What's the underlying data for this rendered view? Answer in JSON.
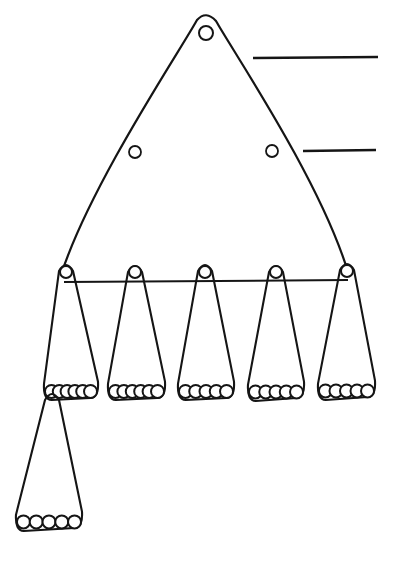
{
  "figure": {
    "background_color": "#ffffff",
    "ink_color": "#151515",
    "canvas": {
      "width": 397,
      "height": 564
    },
    "main_triangle": {
      "name": "large-triangle",
      "apex": {
        "x": 206,
        "y": 17
      },
      "left_base": {
        "x": 62,
        "y": 272
      },
      "right_base": {
        "x": 348,
        "y": 272
      },
      "stroke_width": 2.2,
      "apex_circle": {
        "cx": 206,
        "cy": 33,
        "r": 7
      },
      "side_circles": [
        {
          "name": "left-side-circle",
          "cx": 135,
          "cy": 152,
          "r": 6
        },
        {
          "name": "right-side-circle",
          "cx": 272,
          "cy": 151,
          "r": 6
        }
      ]
    },
    "crossbar": {
      "name": "apex-crossbar",
      "x1": 64,
      "y1": 282,
      "x2": 348,
      "y2": 280,
      "stroke_width": 2
    },
    "small_triangles": [
      {
        "id": "triangle-1",
        "apex": {
          "x": 66,
          "y": 264
        },
        "base_left": {
          "x": 44,
          "y": 396
        },
        "base_right": {
          "x": 98,
          "y": 394
        },
        "apex_circle": {
          "cx": 66,
          "cy": 272,
          "r": 6
        },
        "base_circle_count": 6,
        "base_circle_radius": 6.5
      },
      {
        "id": "triangle-2",
        "apex": {
          "x": 135,
          "y": 265
        },
        "base_left": {
          "x": 108,
          "y": 396
        },
        "base_right": {
          "x": 165,
          "y": 394
        },
        "apex_circle": {
          "cx": 135,
          "cy": 272,
          "r": 6
        },
        "base_circle_count": 6,
        "base_circle_radius": 6.5
      },
      {
        "id": "triangle-3",
        "apex": {
          "x": 205,
          "y": 264
        },
        "base_left": {
          "x": 178,
          "y": 396
        },
        "base_right": {
          "x": 234,
          "y": 394
        },
        "apex_circle": {
          "cx": 205,
          "cy": 272,
          "r": 6
        },
        "base_circle_count": 5,
        "base_circle_radius": 6.5
      },
      {
        "id": "triangle-4",
        "apex": {
          "x": 276,
          "y": 265
        },
        "base_left": {
          "x": 248,
          "y": 397
        },
        "base_right": {
          "x": 304,
          "y": 394
        },
        "apex_circle": {
          "cx": 276,
          "cy": 272,
          "r": 6
        },
        "base_circle_count": 5,
        "base_circle_radius": 6.5
      },
      {
        "id": "triangle-5",
        "apex": {
          "x": 347,
          "y": 263
        },
        "base_left": {
          "x": 318,
          "y": 396
        },
        "base_right": {
          "x": 375,
          "y": 393
        },
        "apex_circle": {
          "cx": 347,
          "cy": 271,
          "r": 6
        },
        "base_circle_count": 5,
        "base_circle_radius": 6.5
      }
    ],
    "bottom_triangle": {
      "id": "triangle-6",
      "apex": {
        "x": 52,
        "y": 393
      },
      "base_left": {
        "x": 16,
        "y": 527
      },
      "base_right": {
        "x": 82,
        "y": 524
      },
      "base_circle_count": 5,
      "base_circle_radius": 6.5
    },
    "rules": [
      {
        "id": "rule-top",
        "x1": 253,
        "y1": 58,
        "x2": 378,
        "y2": 57,
        "stroke_width": 2.6
      },
      {
        "id": "rule-bottom",
        "x1": 303,
        "y1": 151,
        "x2": 376,
        "y2": 150,
        "stroke_width": 2.6
      }
    ]
  }
}
